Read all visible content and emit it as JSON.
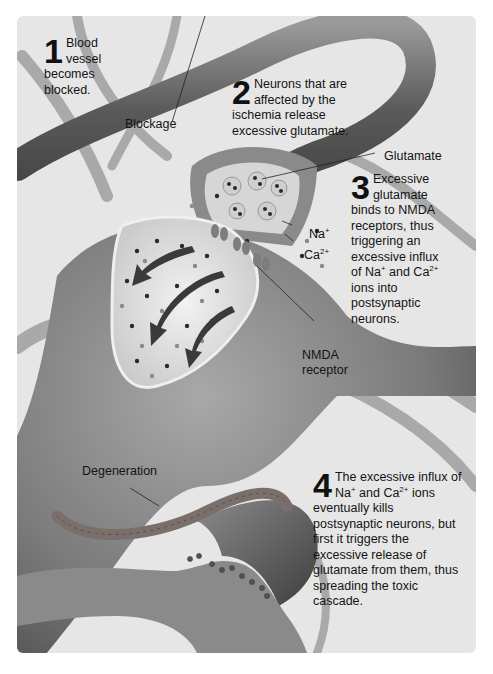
{
  "figure": {
    "steps": [
      {
        "number": "1",
        "text": "Blood vessel becomes blocked."
      },
      {
        "number": "2",
        "text": "Neurons that are affected by the ischemia release excessive glutamate."
      },
      {
        "number": "3",
        "text_parts": [
          "Excessive glutamate binds to NMDA receptors, thus triggering an excessive influx of Na",
          "+",
          " and Ca",
          "2+",
          " ions into postsynaptic neurons."
        ]
      },
      {
        "number": "4",
        "text_parts": [
          "The excessive influx of Na",
          "+",
          " and Ca",
          "2+",
          " ions eventually kills postsynaptic neurons, but first it triggers the excessive release of glutamate from them, thus spreading the toxic cascade."
        ]
      }
    ],
    "labels": {
      "blockage": "Blockage",
      "glutamate": "Glutamate",
      "na": "Na",
      "na_sup": "+",
      "ca": "Ca",
      "ca_sup": "2+",
      "nmda_line1": "NMDA",
      "nmda_line2": "receptor",
      "degeneration": "Degeneration"
    },
    "colors": {
      "background": "#e6e6e6",
      "vessel": "#6e6e6e",
      "neuron": "#8c8c8c",
      "text": "#141414"
    }
  }
}
